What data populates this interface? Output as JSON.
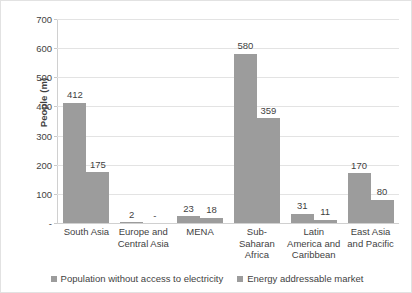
{
  "chart_data": {
    "type": "bar",
    "title": "",
    "xlabel": "",
    "ylabel": "People (m)",
    "ylim": [
      0,
      700
    ],
    "yticks": [
      "-",
      "100",
      "200",
      "300",
      "400",
      "500",
      "600",
      "700"
    ],
    "grid": true,
    "legend_position": "bottom",
    "categories": [
      "South Asia",
      "Europe and Central Asia",
      "MENA",
      "Sub-Saharan Africa",
      "Latin America and Caribbean",
      "East Asia and Pacific"
    ],
    "series": [
      {
        "name": "Population without access to electricity",
        "color": "#9c9c9c",
        "values": [
          412,
          2,
          23,
          580,
          31,
          170
        ],
        "labels": [
          "412",
          "2",
          "23",
          "580",
          "31",
          "170"
        ]
      },
      {
        "name": "Energy addressable market",
        "color": "#9c9c9c",
        "values": [
          175,
          0,
          18,
          359,
          11,
          80
        ],
        "labels": [
          "175",
          "-",
          "18",
          "359",
          "11",
          "80"
        ]
      }
    ]
  },
  "axis": {
    "y_title": "People (m)"
  },
  "legend": {
    "items": [
      {
        "label": "Population without access to electricity"
      },
      {
        "label": "Energy addressable market"
      }
    ]
  }
}
